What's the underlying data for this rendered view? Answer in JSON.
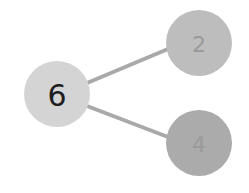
{
  "diagram": {
    "type": "number-bond",
    "whole": {
      "label": "6",
      "cx": 57,
      "cy": 94,
      "r": 33,
      "fill": "#d4d4d4",
      "text_color": "#1e1e1e",
      "font_size": 30
    },
    "parts": [
      {
        "label": "2",
        "cx": 199,
        "cy": 43,
        "r": 33,
        "fill": "#bdbdbd",
        "text_color": "#999999",
        "font_size": 22
      },
      {
        "label": "4",
        "cx": 199,
        "cy": 143,
        "r": 33,
        "fill": "#ababab",
        "text_color": "#9a9a9a",
        "font_size": 22
      }
    ],
    "connectors": [
      {
        "x1": 87,
        "y1": 83,
        "x2": 168,
        "y2": 49
      },
      {
        "x1": 87,
        "y1": 106,
        "x2": 168,
        "y2": 137
      }
    ],
    "connector_color": "#a9a9a9",
    "connector_width": 4
  }
}
